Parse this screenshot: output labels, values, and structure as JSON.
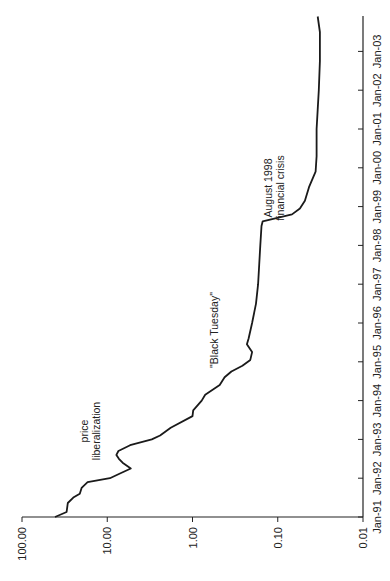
{
  "chart_data": {
    "type": "line",
    "orientation": "rotated-90-ccw",
    "title": "",
    "xlabel": "",
    "ylabel": "",
    "yscale": "log",
    "ylim": [
      0.01,
      100
    ],
    "y_ticks": [
      "100.00",
      "10.00",
      "1.00",
      "0.10",
      "0.01"
    ],
    "x_ticks": [
      "Jan-91",
      "Jan-92",
      "Jan-93",
      "Jan-94",
      "Jan-95",
      "Jan-96",
      "Jan-97",
      "Jan-98",
      "Jan-99",
      "Jan-00",
      "Jan-01",
      "Jan-02",
      "Jan-03"
    ],
    "grid": false,
    "legend": null,
    "line_color": "#1a1a1a",
    "series": [
      {
        "name": "index",
        "points": [
          {
            "date": 1991.0,
            "value": 41
          },
          {
            "date": 1991.13,
            "value": 30
          },
          {
            "date": 1991.36,
            "value": 29
          },
          {
            "date": 1991.5,
            "value": 25
          },
          {
            "date": 1991.6,
            "value": 21
          },
          {
            "date": 1991.75,
            "value": 20
          },
          {
            "date": 1991.9,
            "value": 17
          },
          {
            "date": 1992.0,
            "value": 9.3
          },
          {
            "date": 1992.13,
            "value": 7.0
          },
          {
            "date": 1992.25,
            "value": 5.3
          },
          {
            "date": 1992.4,
            "value": 6.6
          },
          {
            "date": 1992.5,
            "value": 7.3
          },
          {
            "date": 1992.6,
            "value": 7.8
          },
          {
            "date": 1992.7,
            "value": 7.4
          },
          {
            "date": 1992.85,
            "value": 5.4
          },
          {
            "date": 1993.0,
            "value": 3.0
          },
          {
            "date": 1993.1,
            "value": 2.4
          },
          {
            "date": 1993.3,
            "value": 1.8
          },
          {
            "date": 1993.6,
            "value": 1.0
          },
          {
            "date": 1993.75,
            "value": 0.98
          },
          {
            "date": 1994.0,
            "value": 0.78
          },
          {
            "date": 1994.15,
            "value": 0.71
          },
          {
            "date": 1994.4,
            "value": 0.48
          },
          {
            "date": 1994.6,
            "value": 0.42
          },
          {
            "date": 1994.75,
            "value": 0.35
          },
          {
            "date": 1994.9,
            "value": 0.26
          },
          {
            "date": 1995.05,
            "value": 0.21
          },
          {
            "date": 1995.25,
            "value": 0.2
          },
          {
            "date": 1995.45,
            "value": 0.23
          },
          {
            "date": 1995.6,
            "value": 0.22
          },
          {
            "date": 1996.0,
            "value": 0.2
          },
          {
            "date": 1996.5,
            "value": 0.18
          },
          {
            "date": 1997.0,
            "value": 0.17
          },
          {
            "date": 1997.5,
            "value": 0.165
          },
          {
            "date": 1998.0,
            "value": 0.16
          },
          {
            "date": 1998.5,
            "value": 0.155
          },
          {
            "date": 1998.62,
            "value": 0.15
          },
          {
            "date": 1998.8,
            "value": 0.068
          },
          {
            "date": 1998.95,
            "value": 0.055
          },
          {
            "date": 1999.15,
            "value": 0.048
          },
          {
            "date": 1999.5,
            "value": 0.043
          },
          {
            "date": 1999.9,
            "value": 0.036
          },
          {
            "date": 2000.3,
            "value": 0.035
          },
          {
            "date": 2001.0,
            "value": 0.035
          },
          {
            "date": 2001.5,
            "value": 0.034
          },
          {
            "date": 2002.0,
            "value": 0.033
          },
          {
            "date": 2002.75,
            "value": 0.032
          },
          {
            "date": 2003.5,
            "value": 0.032
          },
          {
            "date": 2003.9,
            "value": 0.034
          }
        ]
      }
    ],
    "annotations": [
      {
        "text_lines": [
          "price",
          "liberalization"
        ],
        "date": 1992.0,
        "value": 22
      },
      {
        "text_lines": [
          "\"Black Tuesday\""
        ],
        "date": 1995.3,
        "value": 0.7
      },
      {
        "text_lines": [
          "August 1998",
          "financial crisis"
        ],
        "date": 1998.7,
        "value": 0.1
      }
    ]
  }
}
